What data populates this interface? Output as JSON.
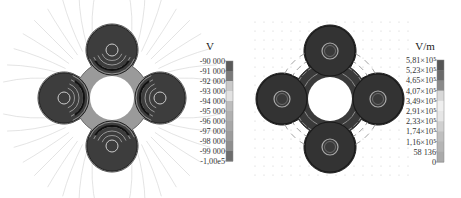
{
  "chart_data": [
    {
      "type": "heatmap",
      "title": "",
      "quantity": "Electric potential",
      "colorbar_unit": "V",
      "colorbar_ticks": [
        "-90 000",
        "-91 000",
        "-92 000",
        "-93 000",
        "-94 000",
        "-95 000",
        "-96 000",
        "-97 000",
        "-98 000",
        "-99 000",
        "-1,00e5"
      ],
      "colorbar_range": [
        -100000,
        -90000
      ],
      "colorbar_colors": [
        "#5a5a5a",
        "#7a7a7a",
        "#c9c9c9",
        "#e2e2e2",
        "#bdbdbd",
        "#b0b0b0",
        "#a7a7a7",
        "#9b9b9b",
        "#8e8e8e",
        "#6c6c6c",
        "#444444"
      ],
      "overlay": "equipotential contours and field lines"
    },
    {
      "type": "heatmap",
      "title": "",
      "quantity": "Electric field magnitude",
      "colorbar_unit": "V/m",
      "colorbar_ticks": [
        "5,81×10⁵",
        "5,23×10⁵",
        "4,65×10⁵",
        "4,07×10⁵",
        "3,49×10⁵",
        "2,91×10⁵",
        "2,33×10⁵",
        "1,74×10⁵",
        "1,16×10⁵",
        "58 136",
        "0"
      ],
      "colorbar_range": [
        0,
        581000
      ],
      "colorbar_colors": [
        "#555555",
        "#6a6a6a",
        "#8a8a8a",
        "#d8d8d8",
        "#efefef",
        "#e6e6e6",
        "#d0d0d0",
        "#bfbfbf",
        "#b5b5b5",
        "#aaaaaa",
        "#9e9e9e"
      ],
      "overlay": "field arrows"
    }
  ]
}
